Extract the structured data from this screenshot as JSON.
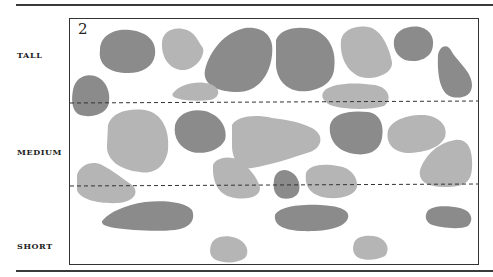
{
  "panel": {
    "number": "2",
    "rows": [
      {
        "label": "TALL"
      },
      {
        "label": "MEDIUM"
      },
      {
        "label": "SHORT"
      }
    ],
    "colors": {
      "dark": "#8b8b8b",
      "light": "#b5b5b5",
      "line": "#333333"
    }
  }
}
